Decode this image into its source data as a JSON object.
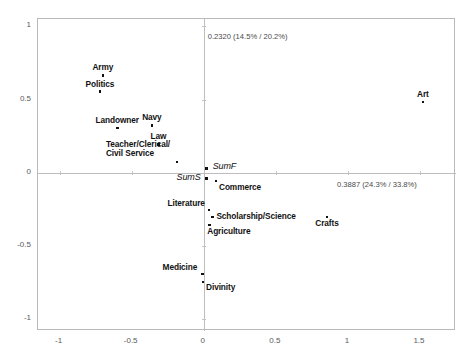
{
  "chart_data": {
    "type": "scatter",
    "title": "",
    "subtitle": "",
    "xlabel": "",
    "ylabel": "",
    "xlim": [
      -1.15,
      1.75
    ],
    "ylim": [
      -1.08,
      1.05
    ],
    "grid": false,
    "legend": null,
    "xticks": [
      "-1",
      "-0.5",
      "0",
      "0.5",
      "1",
      "1.5"
    ],
    "xtick_values": [
      -1,
      -0.5,
      0,
      0.5,
      1,
      1.5
    ],
    "yticks": [
      "1",
      "0.5",
      "0",
      "-0.5",
      "-1"
    ],
    "ytick_values": [
      1,
      0.5,
      0,
      -0.5,
      -1
    ],
    "annotations": {
      "vertical_axis": {
        "eigenvalue": "0.2320",
        "percents": "(14.5% / 20.2%)",
        "full": "0.2320 (14.5% / 20.2%)"
      },
      "horizontal_axis": {
        "eigenvalue": "0.3887",
        "percents": "(24.3% / 33.8%)",
        "full": "0.3887 (24.3% / 33.8%)"
      }
    },
    "points": [
      {
        "label": "Army",
        "x": -0.7,
        "y": 0.665,
        "label_dx": 0,
        "label_dy": -12,
        "anchor": "center",
        "italic": false
      },
      {
        "label": "Politics",
        "x": -0.72,
        "y": 0.555,
        "label_dx": 0,
        "label_dy": -12,
        "anchor": "center",
        "italic": false
      },
      {
        "label": "Landowner",
        "x": -0.6,
        "y": 0.305,
        "label_dx": 0,
        "label_dy": -12,
        "anchor": "center",
        "italic": false
      },
      {
        "label": "Navy",
        "x": -0.36,
        "y": 0.325,
        "label_dx": 0,
        "label_dy": -12,
        "anchor": "center",
        "italic": false
      },
      {
        "label": "Law",
        "x": -0.315,
        "y": 0.195,
        "label_dx": 0,
        "label_dy": -12,
        "anchor": "center",
        "italic": false
      },
      {
        "label": "Teacher/Clerical/\nCivil Service",
        "x": -0.185,
        "y": 0.075,
        "label_dx": -7,
        "label_dy": -22,
        "anchor": "right",
        "italic": false
      },
      {
        "label": "SumF",
        "x": 0.02,
        "y": 0.03,
        "label_dx": 6,
        "label_dy": -6,
        "anchor": "left",
        "italic": true
      },
      {
        "label": "SumS",
        "x": 0.02,
        "y": -0.04,
        "label_dx": -6,
        "label_dy": -6,
        "anchor": "right",
        "italic": true
      },
      {
        "label": "Commerce",
        "x": 0.085,
        "y": -0.055,
        "label_dx": 3,
        "label_dy": 2,
        "anchor": "left",
        "italic": false
      },
      {
        "label": "Literature",
        "x": 0.035,
        "y": -0.255,
        "label_dx": -4,
        "label_dy": -11,
        "anchor": "right",
        "italic": false
      },
      {
        "label": "Scholarship/Science",
        "x": 0.06,
        "y": -0.3,
        "label_dx": 4,
        "label_dy": -5,
        "anchor": "left",
        "italic": false
      },
      {
        "label": "Agriculture",
        "x": 0.038,
        "y": -0.355,
        "label_dx": -2,
        "label_dy": 2,
        "anchor": "left",
        "italic": false
      },
      {
        "label": "Crafts",
        "x": 0.855,
        "y": -0.3,
        "label_dx": 0,
        "label_dy": 2,
        "anchor": "center",
        "italic": false
      },
      {
        "label": "Medicine",
        "x": -0.01,
        "y": -0.69,
        "label_dx": -5,
        "label_dy": -11,
        "anchor": "right",
        "italic": false
      },
      {
        "label": "Divinity",
        "x": -0.005,
        "y": -0.745,
        "label_dx": 3,
        "label_dy": 1,
        "anchor": "left",
        "italic": false
      },
      {
        "label": "Art",
        "x": 1.52,
        "y": 0.485,
        "label_dx": 0,
        "label_dy": -12,
        "anchor": "center",
        "italic": false
      }
    ]
  }
}
